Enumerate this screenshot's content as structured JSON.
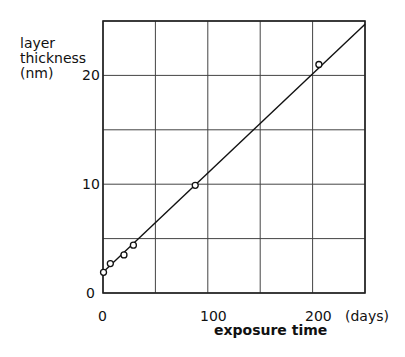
{
  "chart_data": {
    "type": "scatter",
    "title": "",
    "xlabel": "exposure time",
    "xunit": "(days)",
    "ylabel": [
      "layer",
      "thickness",
      "(nm)"
    ],
    "xlim": [
      0,
      250
    ],
    "ylim": [
      0,
      25
    ],
    "xticks": [
      0,
      100,
      200
    ],
    "yticks": [
      0,
      10,
      20
    ],
    "grid": true,
    "grid_x": [
      0,
      50,
      100,
      150,
      200,
      250
    ],
    "grid_y": [
      0,
      5,
      10,
      15,
      20,
      25
    ],
    "series": [
      {
        "name": "measured",
        "marker": "open-circle",
        "x": [
          0.5,
          7,
          20,
          29,
          88,
          206
        ],
        "y": [
          1.9,
          2.7,
          3.5,
          4.4,
          9.9,
          21.0
        ]
      }
    ],
    "fit_line": {
      "x": [
        0,
        250
      ],
      "y": [
        1.9,
        24.7
      ]
    }
  },
  "labels": {
    "ylabel_line1": "layer",
    "ylabel_line2": "thickness",
    "ylabel_line3": "(nm)",
    "ytick_0": "0",
    "ytick_10": "10",
    "ytick_20": "20",
    "xtick_0": "0",
    "xtick_100": "100",
    "xtick_200": "200",
    "xunit": "(days)",
    "xlabel": "exposure time"
  }
}
